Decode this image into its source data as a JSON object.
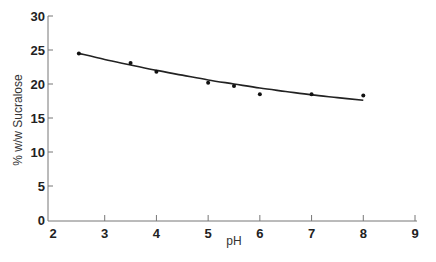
{
  "chart_data": {
    "type": "scatter",
    "title": "",
    "xlabel": "pH",
    "ylabel": "% w/w Sucralose",
    "xlim": [
      2,
      9
    ],
    "ylim": [
      0,
      30
    ],
    "xticks": [
      2,
      3,
      4,
      5,
      6,
      7,
      8,
      9
    ],
    "yticks": [
      0,
      5,
      10,
      15,
      20,
      25,
      30
    ],
    "grid": false,
    "legend": null,
    "series": [
      {
        "name": "measured",
        "kind": "scatter",
        "x": [
          2.5,
          3.5,
          4,
          5,
          5.5,
          6,
          7,
          8
        ],
        "y": [
          24.5,
          23.1,
          21.8,
          20.2,
          19.7,
          18.5,
          18.5,
          18.3
        ]
      },
      {
        "name": "fit",
        "kind": "line",
        "x": [
          2.5,
          3,
          3.5,
          4,
          4.5,
          5,
          5.5,
          6,
          6.5,
          7,
          7.5,
          8
        ],
        "y": [
          24.5,
          23.6,
          22.8,
          22.0,
          21.3,
          20.6,
          20.0,
          19.4,
          18.9,
          18.4,
          18.0,
          17.6
        ]
      }
    ]
  },
  "colors": {
    "axis": "#777777",
    "line": "#222222",
    "marker": "#111111"
  }
}
